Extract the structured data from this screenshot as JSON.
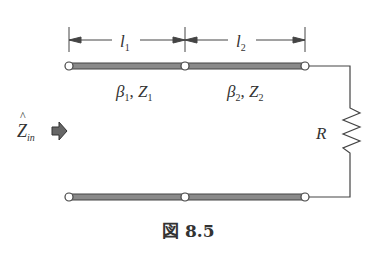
{
  "diagram": {
    "segment1": {
      "length_label": "l",
      "length_sub": "1",
      "beta": "β",
      "beta_sub": "1",
      "z": "Z",
      "z_sub": "1"
    },
    "segment2": {
      "length_label": "l",
      "length_sub": "2",
      "beta": "β",
      "beta_sub": "2",
      "z": "Z",
      "z_sub": "2"
    },
    "input": {
      "label": "Z",
      "hat": "^",
      "sub": "in",
      "arrow_icon": "right-arrow-icon"
    },
    "load": {
      "label": "R"
    },
    "separator": ", ",
    "caption": "図 8.5",
    "colors": {
      "line": "#555555",
      "line_fill": "#8a8a8a",
      "wire": "#444444"
    }
  }
}
